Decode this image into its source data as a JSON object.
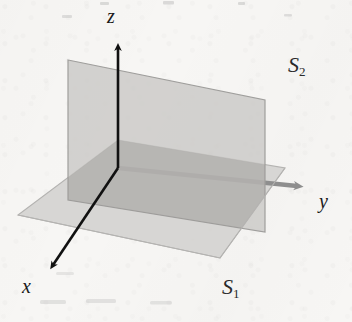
{
  "figure": {
    "title_visible": false,
    "background_color": "#f7f6f4",
    "kind": "3d-coordinate-system-with-two-intersecting-planes"
  },
  "axes": {
    "z": {
      "label": "z",
      "color": "#111111",
      "direction": "up",
      "origin": [
        118,
        168
      ],
      "tip": [
        118,
        42
      ]
    },
    "x": {
      "label": "x",
      "color": "#111111",
      "direction": "down-left",
      "origin": [
        118,
        168
      ],
      "tip": [
        48,
        272
      ]
    },
    "y": {
      "label": "y",
      "color": "#8e8e8e",
      "direction": "right-slightly-down",
      "origin": [
        118,
        168
      ],
      "tip": [
        305,
        188
      ]
    }
  },
  "planes": [
    {
      "name": "S1",
      "label_s": "S",
      "label_sub": "1",
      "orientation": "horizontal",
      "fill_color": "#d5d4d2",
      "border_color": "#b4b3b1",
      "points": "118,140 285,168 220,258 18,215"
    },
    {
      "name": "S2",
      "label_s": "S",
      "label_sub": "2",
      "orientation": "vertical",
      "fill_color": "#c9c8c6",
      "border_color": "#9f9e9c",
      "points": "68,60 265,100 265,232 68,200"
    }
  ],
  "overlap": {
    "fill_color": "#aeadab",
    "description": "region where the two translucent planes cross"
  },
  "colors": {
    "background": "#f7f6f4",
    "axis_dark": "#111111",
    "axis_gray": "#8e8e8e",
    "plane_horizontal": "#d5d4d2",
    "plane_vertical": "#c9c8c6",
    "plane_overlap": "#aeadab",
    "text": "#1a1a1a"
  }
}
